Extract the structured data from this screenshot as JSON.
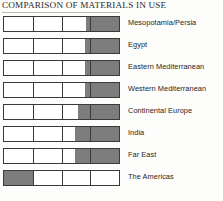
{
  "chart_data": {
    "type": "bar",
    "title": "COMPARISON OF MATERIALS IN USE",
    "xlabel": "",
    "ylabel": "",
    "xlim": [
      0,
      100
    ],
    "grid": true,
    "gridlines": [
      25,
      50,
      75
    ],
    "legend_position": "right-inline",
    "orientation": "horizontal",
    "value_unit": "percent",
    "series_name": "Proportion of materials in use (shaded)",
    "shaded_color": "#7d7d7d",
    "unshaded_color": "#ffffff",
    "outline_color": "#3a3a3a",
    "categories": [
      "Mesopotamia/Persia",
      "Egypt",
      "Eastern Mediterranean",
      "Western Mediterranean",
      "Continental Europe",
      "India",
      "Far East",
      "The Americas"
    ],
    "bars": [
      {
        "label": "Mesopotamia/Persia",
        "fill_start": 71,
        "fill_end": 100,
        "value": 29
      },
      {
        "label": "Egypt",
        "fill_start": 70,
        "fill_end": 100,
        "value": 30
      },
      {
        "label": "Eastern Mediterranean",
        "fill_start": 70,
        "fill_end": 100,
        "value": 30
      },
      {
        "label": "Western Mediterranean",
        "fill_start": 70,
        "fill_end": 100,
        "value": 30
      },
      {
        "label": "Continental Europe",
        "fill_start": 64,
        "fill_end": 100,
        "value": 36
      },
      {
        "label": "India",
        "fill_start": 62,
        "fill_end": 100,
        "value": 38
      },
      {
        "label": "Far East",
        "fill_start": 62,
        "fill_end": 100,
        "value": 38
      },
      {
        "label": "The Americas",
        "fill_start": 0,
        "fill_end": 26,
        "value": 26
      }
    ]
  }
}
